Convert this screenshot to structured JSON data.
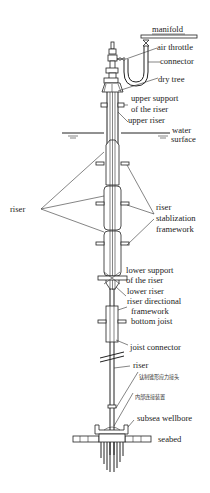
{
  "diagram": {
    "title": "",
    "labels": {
      "manifold": "manifold",
      "air_throttle": "air throttle",
      "connector": "connector",
      "dry_tree": "dry tree",
      "upper_support_1": "upper support",
      "upper_support_2": "of the riser",
      "upper_riser": "upper riser",
      "water_surface_1": "water",
      "water_surface_2": "surface",
      "riser_left": "riser",
      "stabilization_1": "riser",
      "stabilization_2": "stablization",
      "stabilization_3": "framework",
      "lower_support_1": "lower support",
      "lower_support_2": "of the riser",
      "lower_riser": "lower riser",
      "directional_1": "riser directional",
      "directional_2": "framework",
      "directional_3": "bottom joist",
      "joist_connector": "joist connector",
      "riser_lower": "riser",
      "stress_joint_cn": "钛制锥形应力接头",
      "internal_connector_cn": "内部连接装置",
      "subsea_wellbore": "subsea wellbore",
      "seabed": "seabed"
    }
  }
}
